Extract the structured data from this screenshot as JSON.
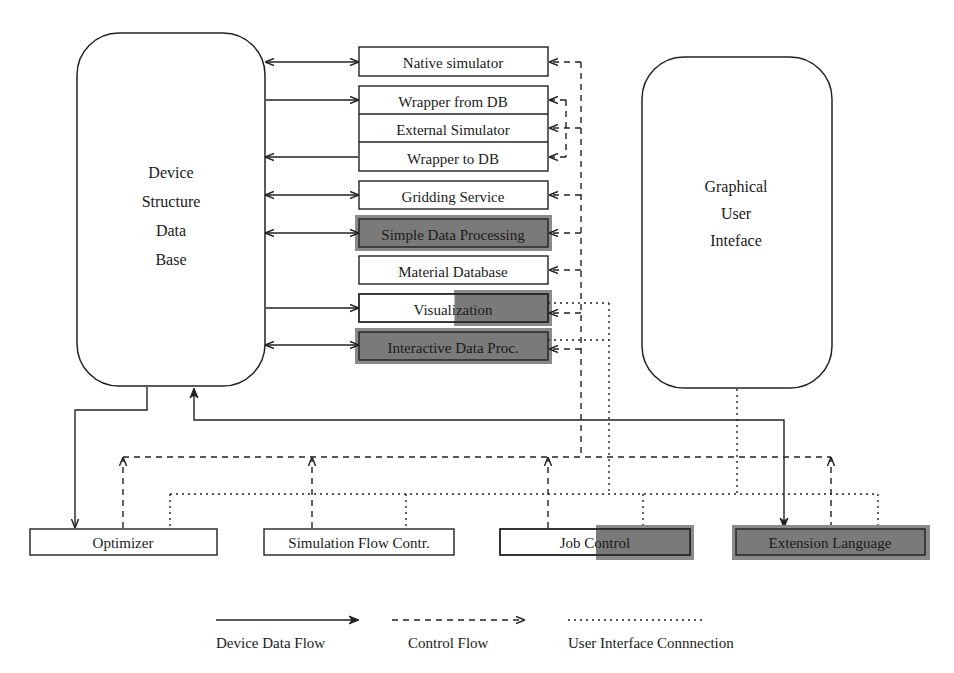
{
  "diagram": {
    "colors": {
      "line": "#222222",
      "shade": "#8a8a8a",
      "shade_inner": "#7a7a7a",
      "background": "#ffffff"
    },
    "device_db": {
      "lines": [
        "Device",
        "Structure",
        "Data",
        "Base"
      ]
    },
    "gui": {
      "lines": [
        "Graphical",
        "User",
        "Inteface"
      ]
    },
    "services": [
      {
        "label": "Native simulator",
        "shaded": "none",
        "flow": "bidirectional"
      },
      {
        "label": "Wrapper from DB",
        "shaded": "none",
        "flow": "to-service"
      },
      {
        "label": "External Simulator",
        "shaded": "none",
        "flow": "none"
      },
      {
        "label": "Wrapper to DB",
        "shaded": "none",
        "flow": "to-db"
      },
      {
        "label": "Gridding Service",
        "shaded": "none",
        "flow": "bidirectional"
      },
      {
        "label": "Simple Data Processing",
        "shaded": "full",
        "flow": "bidirectional"
      },
      {
        "label": "Material Database",
        "shaded": "none",
        "flow": "none"
      },
      {
        "label": "Visualization",
        "shaded": "partial",
        "flow": "to-service"
      },
      {
        "label": "Interactive Data Proc.",
        "shaded": "full",
        "flow": "bidirectional"
      }
    ],
    "bottom_components": [
      {
        "label": "Optimizer",
        "shaded": "none"
      },
      {
        "label": "Simulation Flow Contr.",
        "shaded": "none"
      },
      {
        "label": "Job Control",
        "shaded": "partial"
      },
      {
        "label": "Extension Language",
        "shaded": "full"
      }
    ],
    "legend": [
      {
        "label": "Device Data Flow",
        "style": "solid-arrow"
      },
      {
        "label": "Control Flow",
        "style": "dashed-arrow"
      },
      {
        "label": "User Interface Connnection",
        "style": "dotted-line"
      }
    ]
  }
}
